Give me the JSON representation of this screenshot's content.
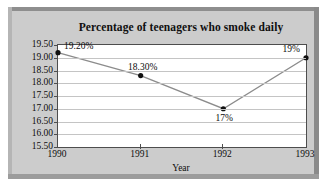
{
  "chart_data": {
    "type": "line",
    "title": "Percentage of teenagers who smoke daily",
    "xlabel": "Year",
    "ylabel": "",
    "categories": [
      "1990",
      "1991",
      "1992",
      "1993"
    ],
    "values": [
      19.2,
      18.3,
      17.0,
      19.0
    ],
    "point_labels": [
      "19.20%",
      "18.30%",
      "17%",
      "19%"
    ],
    "ylim": [
      15.5,
      19.5
    ],
    "ytick_labels": [
      "19.50",
      "19.00",
      "18.50",
      "18.00",
      "17.50",
      "17.00",
      "16.50",
      "16.00",
      "15.50"
    ],
    "ytick_values": [
      19.5,
      19.0,
      18.5,
      18.0,
      17.5,
      17.0,
      16.5,
      16.0,
      15.5
    ],
    "grid": true,
    "legend": false,
    "legend_position": "none",
    "series": [
      {
        "name": "Percentage of teenagers who smoke daily",
        "values": [
          19.2,
          18.3,
          17.0,
          19.0
        ]
      }
    ],
    "colors": {
      "line": "#8c8c8c",
      "marker": "#101010",
      "plot_background": "#ffffff",
      "panel_background": "#cccccc",
      "grid": "#c4c4c4",
      "axis": "#4d4d4d",
      "text": "#0d0d0d"
    }
  }
}
